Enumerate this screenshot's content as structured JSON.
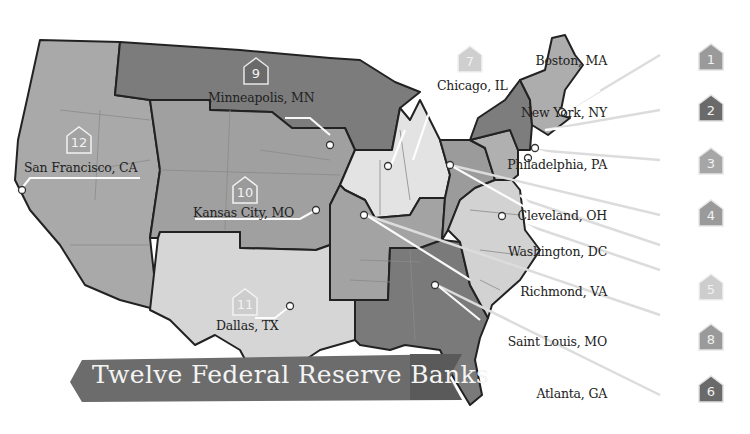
{
  "title": "Twelve Federal Reserve Banks",
  "colors": {
    "background": "#ffffff",
    "dark_region": "#7c7c7c",
    "mid_region": "#a4a4a4",
    "light_region": "#d4d4d4",
    "lightest_region": "#e6e6e6",
    "banner": "#6e6e6e",
    "border": "#222222"
  },
  "districts": [
    {
      "number": "1",
      "city": "Boston, MA",
      "shade": "mid"
    },
    {
      "number": "2",
      "city": "New York, NY",
      "shade": "dark"
    },
    {
      "number": "3",
      "city": "Philadelphia, PA",
      "shade": "mid"
    },
    {
      "number": "4",
      "city": "Cleveland, OH",
      "shade": "mid"
    },
    {
      "number": "5",
      "city": "Richmond, VA",
      "shade": "light"
    },
    {
      "number": "6",
      "city": "Atlanta, GA",
      "shade": "dark"
    },
    {
      "number": "7",
      "city": "Chicago, IL",
      "shade": "light"
    },
    {
      "number": "8",
      "city": "Saint Louis, MO",
      "shade": "mid"
    },
    {
      "number": "9",
      "city": "Minneapolis, MN",
      "shade": "dark"
    },
    {
      "number": "10",
      "city": "Kansas City, MO",
      "shade": "mid"
    },
    {
      "number": "11",
      "city": "Dallas, TX",
      "shade": "light"
    },
    {
      "number": "12",
      "city": "San Francisco, CA",
      "shade": "mid"
    }
  ],
  "extra_labels": {
    "washington": "Washington, DC"
  }
}
